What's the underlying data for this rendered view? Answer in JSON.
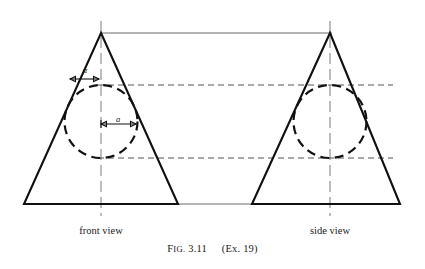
{
  "figure": {
    "caption": {
      "label_prefix_cap": "F",
      "label_prefix_rest": "IG.",
      "number": "3.11",
      "reference": "(Ex. 19)"
    },
    "views": [
      {
        "id": "front",
        "label": "front view",
        "apex": {
          "x": 101,
          "y": 33
        },
        "base_left": {
          "x": 24,
          "y": 204
        },
        "base_right": {
          "x": 178,
          "y": 204
        },
        "centerline_x": 101,
        "circle": {
          "cx": 101,
          "cy": 121.5,
          "r": 36.5
        }
      },
      {
        "id": "side",
        "label": "side view",
        "apex": {
          "x": 330,
          "y": 33
        },
        "base_left": {
          "x": 252,
          "y": 204
        },
        "base_right": {
          "x": 400,
          "y": 204
        },
        "centerline_x": 330,
        "circle": {
          "cx": 330,
          "cy": 121.5,
          "r": 36.5
        }
      }
    ],
    "annotations": {
      "angle_symbol": "α",
      "radius_symbol": "a"
    },
    "projection_lines": {
      "upper_y": 85,
      "lower_y": 158,
      "apex_y": 33,
      "base_y": 204
    },
    "colors": {
      "outline": "#111111",
      "centerline": "#6e6e6e",
      "projection": "#555555",
      "background": "#ffffff",
      "text": "#1a1a1a"
    }
  }
}
